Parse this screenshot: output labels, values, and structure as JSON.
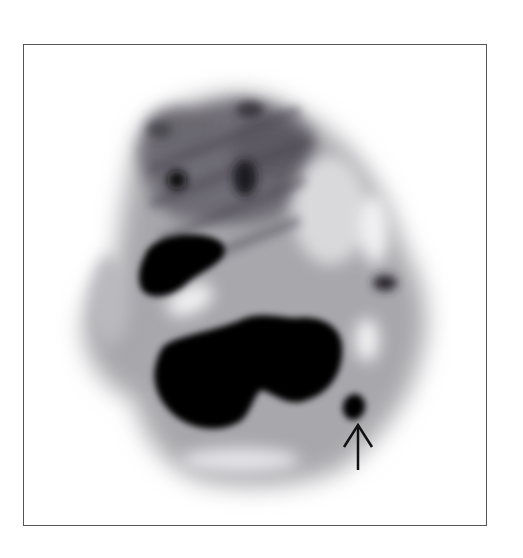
{
  "figure": {
    "type": "nuclear-medicine-scan",
    "annotation": {
      "kind": "arrow",
      "direction": "up",
      "color": "#111111",
      "target_label": "focal-uptake-lesion"
    },
    "colors": {
      "background": "#ffffff",
      "frame_border": "#555555",
      "max_uptake": "#000000",
      "tissue": "#9a9a9e"
    }
  }
}
